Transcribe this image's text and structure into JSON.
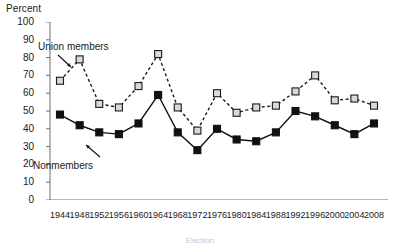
{
  "chart_data": {
    "type": "line",
    "title": "",
    "xlabel": "Election",
    "ylabel": "Percent",
    "ylim": [
      0,
      100
    ],
    "ytick_step": 10,
    "yticks": [
      0,
      10,
      20,
      30,
      40,
      50,
      60,
      70,
      80,
      90,
      100
    ],
    "grid": false,
    "legend_position": "inline-annotation",
    "categories": [
      1944,
      1948,
      1952,
      1956,
      1960,
      1964,
      1968,
      1972,
      1976,
      1980,
      1984,
      1988,
      1992,
      1996,
      2000,
      2004,
      2008
    ],
    "xtick_labels": [
      "1944",
      "1948",
      "1952",
      "1956",
      "1960",
      "1964",
      "1968",
      "1972",
      "1976",
      "1980",
      "1984",
      "1988",
      "1992",
      "1996",
      "2000",
      "2004",
      "2008"
    ],
    "series": [
      {
        "name": "Union members",
        "marker": "open-square",
        "line_style": "dashed",
        "color": "#1a1a1a",
        "marker_fill": "#d9d9d9",
        "values": [
          67,
          79,
          54,
          52,
          64,
          82,
          52,
          39,
          60,
          49,
          52,
          53,
          61,
          70,
          56,
          57,
          53
        ]
      },
      {
        "name": "Nonmembers",
        "marker": "filled-square",
        "line_style": "solid",
        "color": "#111111",
        "marker_fill": "#111111",
        "values": [
          48,
          42,
          38,
          37,
          43,
          59,
          38,
          28,
          40,
          34,
          33,
          38,
          50,
          47,
          42,
          37,
          43
        ]
      }
    ],
    "annotations": [
      {
        "text": "Union members",
        "series": "Union members",
        "points_to_year": 1944
      },
      {
        "text": "Nonmembers",
        "series": "Nonmembers",
        "points_to_year": 1952
      }
    ]
  },
  "axes": {
    "y_title": "Percent",
    "x_caption": "Election"
  }
}
